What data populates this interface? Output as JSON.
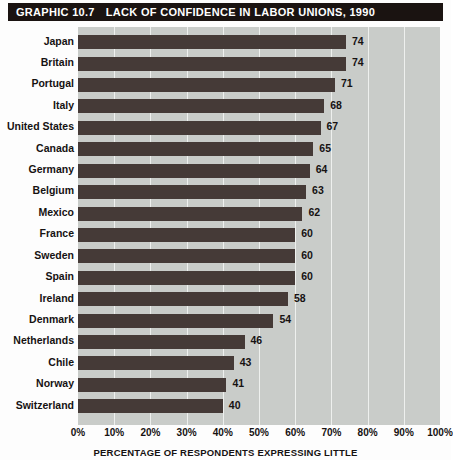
{
  "header": {
    "graphic_number": "GRAPHIC 10.7",
    "title": "LACK OF CONFIDENCE IN LABOR UNIONS, 1990"
  },
  "caption": "PERCENTAGE OF RESPONDENTS EXPRESSING LITTLE",
  "colors": {
    "title_bar_bg": "#1a1311",
    "title_bar_text": "#ffffff",
    "bar_fill": "#453a37",
    "plot_bg": "#c9ccc9",
    "gridline": "#eef0ee",
    "text": "#161212"
  },
  "chart_data": {
    "type": "bar",
    "orientation": "horizontal",
    "title": "LACK OF CONFIDENCE IN LABOR UNIONS, 1990",
    "subtitle": "GRAPHIC 10.7",
    "xlabel": "PERCENTAGE OF RESPONDENTS EXPRESSING LITTLE",
    "ylabel": "",
    "xlim": [
      0,
      100
    ],
    "grid": true,
    "legend": "none",
    "xticks": [
      "0%",
      "10%",
      "20%",
      "30%",
      "40%",
      "50%",
      "60%",
      "70%",
      "80%",
      "90%",
      "100%"
    ],
    "xtick_values": [
      0,
      10,
      20,
      30,
      40,
      50,
      60,
      70,
      80,
      90,
      100
    ],
    "categories": [
      "Japan",
      "Britain",
      "Portugal",
      "Italy",
      "United States",
      "Canada",
      "Germany",
      "Belgium",
      "Mexico",
      "France",
      "Sweden",
      "Spain",
      "Ireland",
      "Denmark",
      "Netherlands",
      "Chile",
      "Norway",
      "Switzerland"
    ],
    "values": [
      74,
      74,
      71,
      68,
      67,
      65,
      64,
      63,
      62,
      60,
      60,
      60,
      58,
      54,
      46,
      43,
      41,
      40
    ],
    "value_labels": [
      "74",
      "74",
      "71",
      "68",
      "67",
      "65",
      "64",
      "63",
      "62",
      "60",
      "60",
      "60",
      "58",
      "54",
      "46",
      "43",
      "41",
      "40"
    ]
  }
}
